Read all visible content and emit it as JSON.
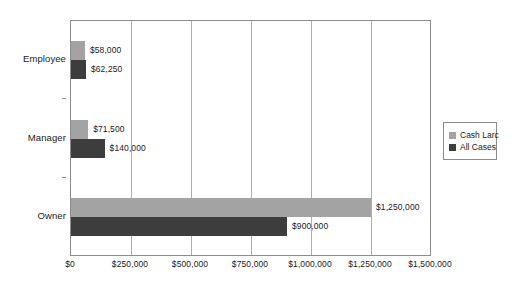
{
  "chart_data": {
    "type": "bar",
    "orientation": "horizontal",
    "title": "",
    "xlabel": "",
    "ylabel": "",
    "categories": [
      "Employee",
      "Manager",
      "Owner"
    ],
    "series": [
      {
        "name": "Cash Larc",
        "color": "#a3a3a3",
        "values": [
          58000,
          71500,
          1250000
        ],
        "labels": [
          "$58,000",
          "$71,500",
          "$1,250,000"
        ]
      },
      {
        "name": "All Cases",
        "color": "#3d3d3d",
        "values": [
          62250,
          140000,
          900000
        ],
        "labels": [
          "$62,250",
          "$140,000",
          "$900,000"
        ]
      }
    ],
    "xlim": [
      0,
      1500000
    ],
    "xticks": [
      0,
      250000,
      500000,
      750000,
      1000000,
      1250000,
      1500000
    ],
    "xtick_labels": [
      "$0",
      "$250,000",
      "$500,000",
      "$750,000",
      "$1,000,000",
      "$1,250,000",
      "$1,500,000"
    ],
    "grid": "vertical",
    "legend_position": "right"
  },
  "legend": {
    "items": [
      {
        "label": "Cash Larc",
        "swatch": "s0"
      },
      {
        "label": "All Cases",
        "swatch": "s1"
      }
    ]
  }
}
